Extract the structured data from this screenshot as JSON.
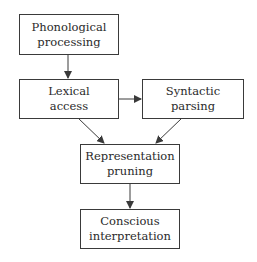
{
  "diagram": {
    "type": "flowchart",
    "nodes": [
      {
        "id": "phonological",
        "lines": [
          "Phonological",
          "processing"
        ]
      },
      {
        "id": "lexical",
        "lines": [
          "Lexical",
          "access"
        ]
      },
      {
        "id": "syntactic",
        "lines": [
          "Syntactic",
          "parsing"
        ]
      },
      {
        "id": "pruning",
        "lines": [
          "Representation",
          "pruning"
        ]
      },
      {
        "id": "conscious",
        "lines": [
          "Conscious",
          "interpretation"
        ]
      }
    ],
    "edges": [
      {
        "from": "phonological",
        "to": "lexical"
      },
      {
        "from": "lexical",
        "to": "syntactic"
      },
      {
        "from": "lexical",
        "to": "pruning"
      },
      {
        "from": "syntactic",
        "to": "pruning"
      },
      {
        "from": "pruning",
        "to": "conscious"
      }
    ],
    "colors": {
      "line": "#3a3a3a",
      "text": "#2a2a2a",
      "background": "#ffffff"
    }
  }
}
